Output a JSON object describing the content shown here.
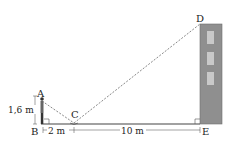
{
  "diagram": {
    "points": {
      "A": "A",
      "B": "B",
      "C": "C",
      "D": "D",
      "E": "E"
    },
    "measurements": {
      "height_AB": "1,6 m",
      "distance_BC": "2 m",
      "distance_CE": "10 m"
    },
    "colors": {
      "building": "#8f8f8f",
      "window": "#c9c9c9",
      "lines": "#333333",
      "ground": "#444444"
    }
  }
}
